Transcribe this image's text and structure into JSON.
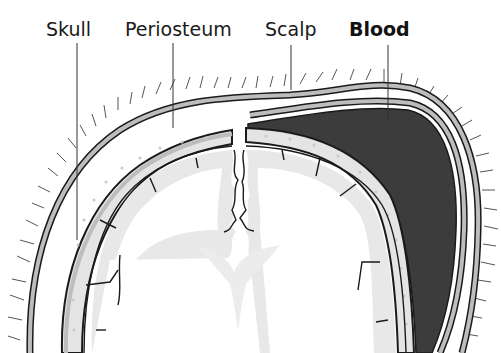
{
  "diagram": {
    "labels": [
      {
        "id": "skull",
        "text": "Skull",
        "bold": false
      },
      {
        "id": "periosteum",
        "text": "Periosteum",
        "bold": false
      },
      {
        "id": "scalp",
        "text": "Scalp",
        "bold": false
      },
      {
        "id": "blood",
        "text": "Blood",
        "bold": true
      }
    ],
    "colors": {
      "outline": "#1a1a1a",
      "layer_gray": "#bdbdbd",
      "bone_fill": "#e4e4e4",
      "brain_fill": "#e8e8e8",
      "blood": "#3c3c3c",
      "background": "#ffffff"
    }
  }
}
